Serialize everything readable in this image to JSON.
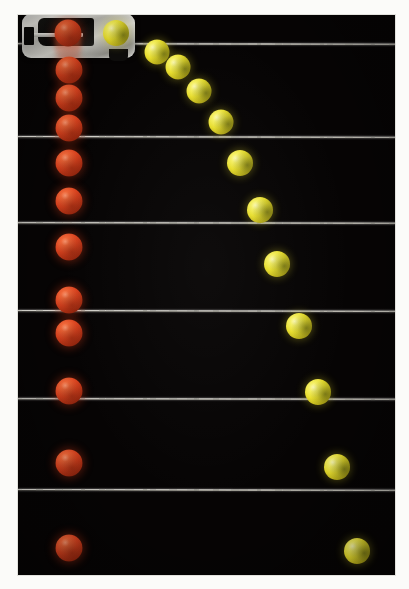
{
  "figure": {
    "name": "strobe-photograph-projectile-vs-freefall",
    "description": "Multiflash strobe photograph: a red ball dropped straight down and a yellow ball launched horizontally at the same instant fall at identical rates, crossing each horizontal reference wire together.",
    "photo": {
      "left": 18,
      "top": 15,
      "width": 377,
      "height": 560,
      "background_color": "#060404",
      "surround_color": "#fbfbf9"
    },
    "apparatus": {
      "label": "spring-loaded simultaneous-release launcher",
      "left": 22,
      "top": 14,
      "width": 113,
      "height": 44
    },
    "release_smear": {
      "label": "motion-blur smear of released red ball",
      "cx": 68,
      "top": 22,
      "width": 26,
      "height": 42
    }
  },
  "wires": [
    {
      "id": "wire-1",
      "label": "reference wire 1",
      "y": 43,
      "tilt": 1
    },
    {
      "id": "wire-2",
      "label": "reference wire 2",
      "y": 136,
      "tilt": 2
    },
    {
      "id": "wire-3",
      "label": "reference wire 3",
      "y": 222,
      "tilt": 1
    },
    {
      "id": "wire-4",
      "label": "reference wire 4",
      "y": 310,
      "tilt": 2
    },
    {
      "id": "wire-5",
      "label": "reference wire 5",
      "y": 398,
      "tilt": 1
    },
    {
      "id": "wire-6",
      "label": "reference wire 6",
      "y": 489,
      "tilt": 2
    }
  ],
  "balls": {
    "red": {
      "color": "#d9431f",
      "label": "red ball - dropped vertically (free fall)",
      "positions": [
        {
          "cx": 68,
          "cy": 33,
          "d": 27
        },
        {
          "cx": 69,
          "cy": 70,
          "d": 27
        },
        {
          "cx": 69,
          "cy": 98,
          "d": 27
        },
        {
          "cx": 69,
          "cy": 128,
          "d": 27
        },
        {
          "cx": 69,
          "cy": 163,
          "d": 27
        },
        {
          "cx": 69,
          "cy": 201,
          "d": 27
        },
        {
          "cx": 69,
          "cy": 247,
          "d": 27
        },
        {
          "cx": 69,
          "cy": 300,
          "d": 27
        },
        {
          "cx": 69,
          "cy": 333,
          "d": 27
        },
        {
          "cx": 69,
          "cy": 391,
          "d": 27
        },
        {
          "cx": 69,
          "cy": 463,
          "d": 27
        },
        {
          "cx": 69,
          "cy": 548,
          "d": 27
        }
      ]
    },
    "yellow": {
      "color": "#e8de2e",
      "label": "yellow ball - launched horizontally (projectile)",
      "positions": [
        {
          "cx": 116,
          "cy": 33,
          "d": 26
        },
        {
          "cx": 157,
          "cy": 52,
          "d": 25
        },
        {
          "cx": 178,
          "cy": 67,
          "d": 25
        },
        {
          "cx": 199,
          "cy": 91,
          "d": 25
        },
        {
          "cx": 221,
          "cy": 122,
          "d": 25
        },
        {
          "cx": 240,
          "cy": 163,
          "d": 26
        },
        {
          "cx": 260,
          "cy": 210,
          "d": 26
        },
        {
          "cx": 277,
          "cy": 264,
          "d": 26
        },
        {
          "cx": 299,
          "cy": 326,
          "d": 26
        },
        {
          "cx": 318,
          "cy": 392,
          "d": 26
        },
        {
          "cx": 337,
          "cy": 467,
          "d": 26
        },
        {
          "cx": 357,
          "cy": 551,
          "d": 26
        }
      ]
    }
  }
}
